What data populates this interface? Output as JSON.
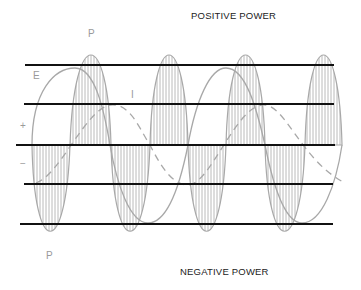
{
  "diagram": {
    "top_label": "POSITIVE POWER",
    "bottom_label": "NEGATIVE POWER",
    "labels": {
      "power_top": "P",
      "power_bottom": "P",
      "voltage": "E",
      "current": "I",
      "plus": "+",
      "minus": "−"
    },
    "colors": {
      "lines": "#111111",
      "curves": "#a8a8a8"
    },
    "horizontal_lines_y": [
      65,
      104,
      145,
      184,
      224
    ]
  }
}
